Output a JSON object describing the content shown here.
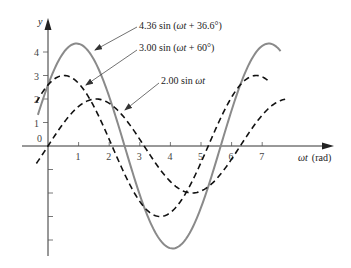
{
  "chart_data": {
    "type": "line",
    "title": "",
    "xlabel": "ωt (rad)",
    "ylabel": "y",
    "x_ticks": [
      "1",
      "2",
      "3",
      "4",
      "5",
      "6",
      "7"
    ],
    "y_ticks": [
      "0",
      "1",
      "2",
      "3",
      "4"
    ],
    "xlim": [
      -0.4,
      9.3
    ],
    "ylim": [
      -4.6,
      5.4
    ],
    "grid": false,
    "legend": "annotations with leader arrows",
    "series": [
      {
        "name": "4.36 sin (ωt + 36.6°)",
        "amplitude": 4.36,
        "phase_deg": 36.6,
        "x_range": [
          -0.33,
          7.6
        ],
        "style": "solid",
        "color": "#8a8a8a"
      },
      {
        "name": "3.00 sin (ωt + 60°)",
        "amplitude": 3.0,
        "phase_deg": 60,
        "x_range": [
          -0.38,
          7.25
        ],
        "style": "dashed",
        "color": "#111111"
      },
      {
        "name": "2.00 sin ωt",
        "amplitude": 2.0,
        "phase_deg": 0,
        "x_range": [
          -0.38,
          7.75
        ],
        "style": "dashed",
        "color": "#111111"
      }
    ],
    "annotations": [
      {
        "text_parts": [
          "4.36 sin (",
          "ωt",
          " + 36.6°)"
        ],
        "label_xy": [
          139,
          29
        ],
        "arrow_from": [
          137,
          27
        ],
        "arrow_to": [
          95,
          50
        ]
      },
      {
        "text_parts": [
          "3.00 sin (",
          "ωt",
          " + 60°)"
        ],
        "label_xy": [
          139,
          51
        ],
        "arrow_from": [
          137,
          50
        ],
        "arrow_to": [
          86,
          85
        ]
      },
      {
        "text_parts": [
          "2.00 sin ",
          "ωt",
          ""
        ],
        "label_xy": [
          161,
          84
        ],
        "arrow_from": [
          159,
          83
        ],
        "arrow_to": [
          125,
          110
        ]
      }
    ]
  },
  "labels": {
    "y_axis": "y",
    "x_axis_italic": "ωt",
    "x_axis_unit": "(rad)",
    "zero": "0"
  }
}
